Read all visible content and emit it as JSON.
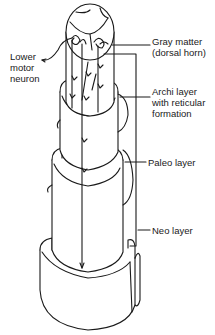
{
  "figure": {
    "labels": {
      "lower_motor_neuron": [
        "Lower",
        "motor",
        "neuron"
      ],
      "gray_matter": [
        "Gray matter",
        "(dorsal horn)"
      ],
      "archi_layer": [
        "Archi layer",
        "with reticular",
        "formation"
      ],
      "paleo_layer": [
        "Paleo layer"
      ],
      "neo_layer": [
        "Neo layer"
      ]
    },
    "colors": {
      "ink": "#1a1a1a",
      "background": "#ffffff"
    }
  }
}
